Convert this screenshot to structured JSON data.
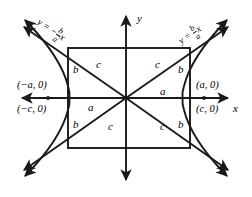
{
  "figure": {
    "stroke_color": "#1a1a1a",
    "background_color": "#ffffff"
  },
  "axes": {
    "x_label": "x",
    "y_label": "y"
  },
  "points": {
    "vertex_left": "(−a, 0)",
    "vertex_right": "(a, 0)",
    "focus_left": "(−c, 0)",
    "focus_right": "(c, 0)"
  },
  "asymptotes": {
    "left": {
      "prefix": "y = −",
      "numerator": "b",
      "denominator": "a",
      "suffix": "x"
    },
    "right": {
      "prefix": "y = ",
      "numerator": "b",
      "denominator": "a",
      "suffix": "x"
    }
  },
  "segments": {
    "a_upper_right": "a",
    "a_lower_left": "a",
    "b_upper_left": "b",
    "b_upper_right": "b",
    "b_lower_left": "b",
    "b_lower_right": "b",
    "c_upper_left": "c",
    "c_upper_right": "c",
    "c_lower_left": "c",
    "c_lower_right": "c"
  }
}
